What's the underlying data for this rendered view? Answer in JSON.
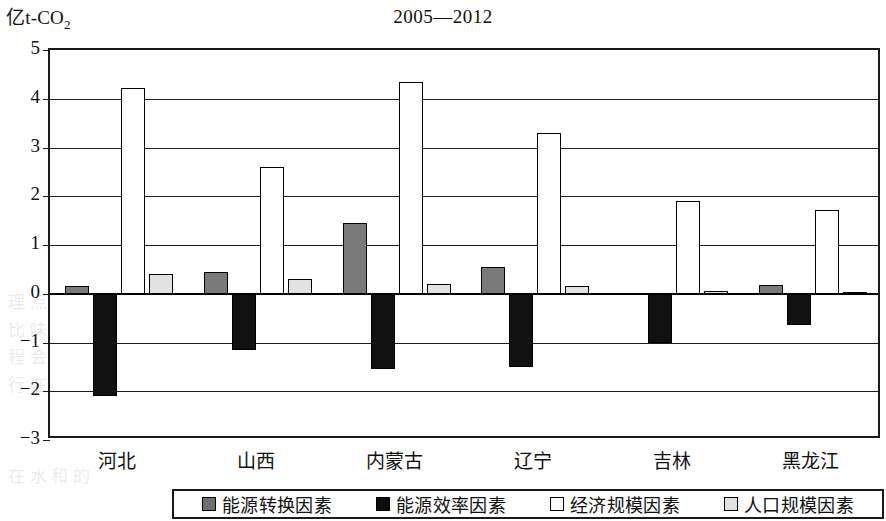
{
  "unit_label": {
    "prefix": "亿t-CO",
    "subscript": "2"
  },
  "title": "2005—2012",
  "axis": {
    "y_ticks": [
      "5",
      "4",
      "3",
      "2",
      "1",
      "0",
      "-1",
      "-2",
      "-3"
    ],
    "y_min": -3,
    "y_max": 5
  },
  "legend": {
    "items": [
      {
        "label": "能源转换因素",
        "swatch": "gray-swatch",
        "color": "#6f6f6f"
      },
      {
        "label": "能源效率因素",
        "swatch": "black-swatch",
        "color": "#0d0d0d"
      },
      {
        "label": "经济规模因素",
        "swatch": "white-swatch",
        "color": "#ffffff"
      },
      {
        "label": "人口规模因素",
        "swatch": "light-gray-swatch",
        "color": "#e2e2e2"
      }
    ]
  },
  "chart_data": {
    "type": "bar",
    "title": "2005—2012",
    "xlabel": "",
    "ylabel": "亿t-CO2",
    "ylim": [
      -3,
      5
    ],
    "grid": true,
    "legend_position": "bottom",
    "categories": [
      "河北",
      "山西",
      "内蒙古",
      "辽宁",
      "吉林",
      "黑龙江"
    ],
    "series": [
      {
        "name": "能源转换因素",
        "color": "#6f6f6f",
        "values": [
          0.15,
          0.45,
          1.45,
          0.55,
          0.02,
          0.18
        ]
      },
      {
        "name": "能源效率因素",
        "color": "#0d0d0d",
        "values": [
          -2.1,
          -1.15,
          -1.55,
          -1.5,
          -1.0,
          -0.65
        ]
      },
      {
        "name": "经济规模因素",
        "color": "#ffffff",
        "values": [
          4.22,
          2.6,
          4.35,
          3.3,
          1.9,
          1.72
        ]
      },
      {
        "name": "人口规模因素",
        "color": "#e2e2e2",
        "values": [
          0.4,
          0.3,
          0.2,
          0.15,
          0.05,
          0.03
        ]
      }
    ]
  },
  "ghost_text": [
    {
      "text": "化 的 革 的 在 世 间 提 值 原 大 不 在 业 习 面 供 据 产 山 期",
      "x": 120,
      "y": 72
    },
    {
      "text": "革 国 新 高 的 内 在 会 日 中",
      "x": 470,
      "y": 178
    },
    {
      "text": "量 要 重 不 下",
      "x": 520,
      "y": 230
    },
    {
      "text": "理 点 量 国 最 业 工 增 省 级 第 这 区 地 的 最 等 级 点",
      "x": 8,
      "y": 288
    },
    {
      "text": "比 味 完 施 时 重 工 区 第 低 的 时 几 因 地 当 是 原",
      "x": 8,
      "y": 316
    },
    {
      "text": "程 会 地 量 中 业 在 的 的 最 中 一 不 大 下 作 大 同 能",
      "x": 8,
      "y": 343
    },
    {
      "text": "行 在 上 下 作 上 省 量 黑 的 西 山 东 工 重 业 工 副",
      "x": 8,
      "y": 371
    },
    {
      "text": "在 水 和 的",
      "x": 8,
      "y": 462
    }
  ]
}
